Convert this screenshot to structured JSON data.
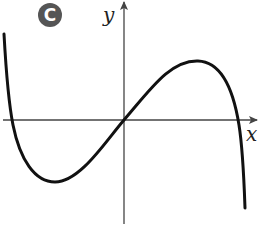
{
  "badge": {
    "label": "C",
    "color": "#555555"
  },
  "axes": {
    "x_label": "x",
    "y_label": "y",
    "color": "#444444"
  },
  "curve": {
    "description": "Cubic-like function: starts high on the left, dips to a local minimum in quadrant III, passes through the origin, reaches a local maximum in quadrant I, then falls steeply to the right",
    "color": "#111111"
  }
}
